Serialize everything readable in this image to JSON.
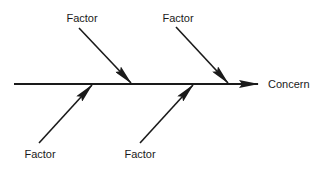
{
  "diagram": {
    "type": "cause-and-effect (fishbone)",
    "effect": {
      "label": "Concern"
    },
    "factors": [
      {
        "id": "top-left",
        "label": "Factor",
        "side": "top"
      },
      {
        "id": "top-right",
        "label": "Factor",
        "side": "top"
      },
      {
        "id": "bottom-left",
        "label": "Factor",
        "side": "bottom"
      },
      {
        "id": "bottom-right",
        "label": "Factor",
        "side": "bottom"
      }
    ],
    "colors": {
      "line": "#1a1a1a",
      "background": "#ffffff"
    }
  }
}
